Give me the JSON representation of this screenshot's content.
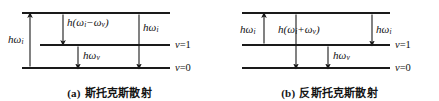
{
  "figure": {
    "panels": [
      {
        "id": "a",
        "caption_tag": "(a)",
        "caption_text": "斯托克斯散射",
        "levels": [
          {
            "name": "virtual-level",
            "label": ""
          },
          {
            "name": "v1-level",
            "label": "v=1"
          },
          {
            "name": "v0-level",
            "label": "v=0"
          }
        ],
        "level_labels": {
          "upper": "v=1",
          "lower": "v=0"
        },
        "arrows": [
          {
            "name": "incident-photon-arrow",
            "direction": "up",
            "label_h": "h",
            "label_omega": "ω",
            "label_sub": "i"
          },
          {
            "name": "scattered-photon-arrow",
            "direction": "down",
            "label_full": "h(ω",
            "label_sub1": "i",
            "label_mid": "−ω",
            "label_sub2": "v",
            "label_end": ")"
          },
          {
            "name": "vibrational-quantum-arrow",
            "direction": "down",
            "label_h": "h",
            "label_omega": "ω",
            "label_sub": "v"
          },
          {
            "name": "excitation-arrow",
            "direction": "down",
            "label_h": "h",
            "label_omega": "ω",
            "label_sub": "i"
          }
        ]
      },
      {
        "id": "b",
        "caption_tag": "(b)",
        "caption_text": "反斯托克斯散射",
        "levels": [
          {
            "name": "virtual-level",
            "label": ""
          },
          {
            "name": "v1-level",
            "label": "v=1"
          },
          {
            "name": "v0-level",
            "label": "v=0"
          }
        ],
        "level_labels": {
          "upper": "v=1",
          "lower": "v=0"
        },
        "arrows": [
          {
            "name": "incident-photon-arrow",
            "direction": "up",
            "label_h": "h",
            "label_omega": "ω",
            "label_sub": "i"
          },
          {
            "name": "scattered-photon-arrow",
            "direction": "down",
            "label_full": "h(ω",
            "label_sub1": "i",
            "label_mid": "+ω",
            "label_sub2": "v",
            "label_end": ")"
          },
          {
            "name": "vibrational-quantum-arrow",
            "direction": "down",
            "label_h": "h",
            "label_omega": "ω",
            "label_sub": "v"
          },
          {
            "name": "relaxation-arrow",
            "direction": "down",
            "label_h": "h",
            "label_omega": "ω",
            "label_sub": "i"
          }
        ]
      }
    ],
    "labels": {
      "a": {
        "left_arrow": "hω",
        "left_arrow_sub": "i",
        "mid_arrow_prefix": "h(ω",
        "mid_arrow_sub1": "i",
        "mid_arrow_op": "−ω",
        "mid_arrow_sub2": "v",
        "mid_arrow_suffix": ")",
        "low_arrow": "hω",
        "low_arrow_sub": "v",
        "right_arrow": "hω",
        "right_arrow_sub": "i",
        "v_upper_var": "v",
        "v_upper_val": "=1",
        "v_lower_var": "v",
        "v_lower_val": "=0"
      },
      "b": {
        "left_arrow": "hω",
        "left_arrow_sub": "i",
        "mid_arrow_prefix": "h(ω",
        "mid_arrow_sub1": "i",
        "mid_arrow_op": "+ω",
        "mid_arrow_sub2": "v",
        "mid_arrow_suffix": ")",
        "low_arrow": "hω",
        "low_arrow_sub": "v",
        "right_arrow": "hω",
        "right_arrow_sub": "i",
        "v_upper_var": "v",
        "v_upper_val": "=1",
        "v_lower_var": "v",
        "v_lower_val": "=0"
      }
    },
    "colors": {
      "line": "#1a1a1a",
      "text": "#111111",
      "background": "#ffffff"
    }
  }
}
